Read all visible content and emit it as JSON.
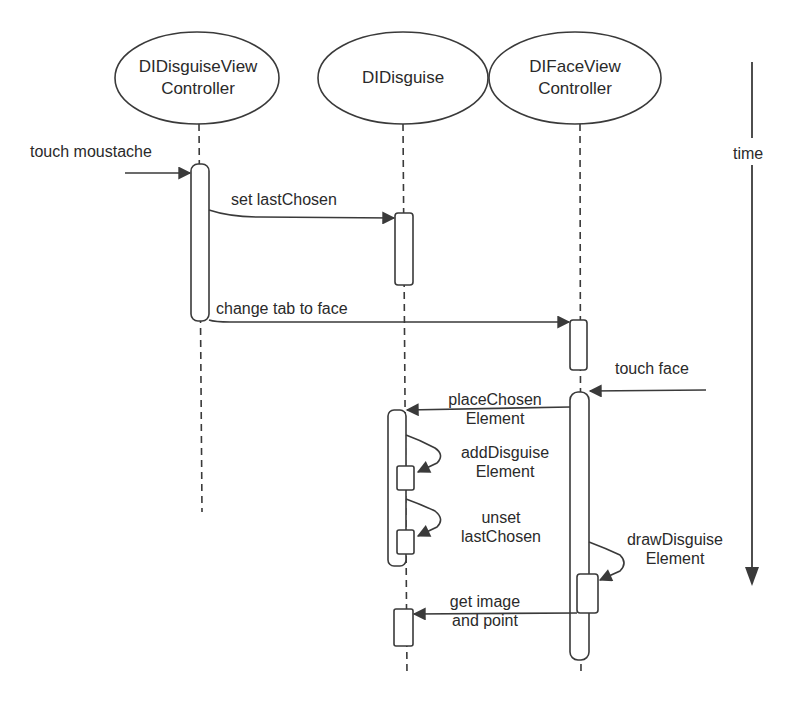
{
  "diagram": {
    "type": "sequence",
    "colors": {
      "line": "#3a3a3a",
      "background": "#ffffff",
      "text": "#2a2a2a"
    },
    "participants": [
      {
        "id": "p1",
        "line1": "DIDisguiseView",
        "line2": "Controller"
      },
      {
        "id": "p2",
        "line1": "DIDisguise",
        "line2": ""
      },
      {
        "id": "p3",
        "line1": "DIFaceView",
        "line2": "Controller"
      }
    ],
    "time_axis": {
      "label": "time"
    },
    "messages": [
      {
        "id": "m1",
        "line1": "touch moustache",
        "line2": "",
        "from": "external",
        "to": "p1"
      },
      {
        "id": "m2",
        "line1": "set lastChosen",
        "line2": "",
        "from": "p1",
        "to": "p2"
      },
      {
        "id": "m3",
        "line1": "change tab to face",
        "line2": "",
        "from": "p1",
        "to": "p3"
      },
      {
        "id": "m4",
        "line1": "touch face",
        "line2": "",
        "from": "external",
        "to": "p3"
      },
      {
        "id": "m5",
        "line1": "placeChosen",
        "line2": "Element",
        "from": "p3",
        "to": "p2"
      },
      {
        "id": "m6",
        "line1": "addDisguise",
        "line2": "Element",
        "from": "p2",
        "to": "p2"
      },
      {
        "id": "m7",
        "line1": "unset",
        "line2": "lastChosen",
        "from": "p2",
        "to": "p2"
      },
      {
        "id": "m8",
        "line1": "drawDisguise",
        "line2": "Element",
        "from": "p3",
        "to": "p3"
      },
      {
        "id": "m9",
        "line1": "get image",
        "line2": "and point",
        "from": "p3",
        "to": "p2"
      }
    ]
  }
}
